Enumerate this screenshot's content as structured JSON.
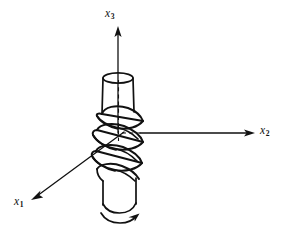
{
  "figure": {
    "background_color": "#ffffff",
    "line_color": "#111111"
  },
  "axes": [
    {
      "id": "x1",
      "label_base": "x",
      "label_subscript": "1",
      "direction": "lower-left (out of page toward viewer)",
      "origin": [
        122,
        133
      ],
      "tip": [
        32,
        200
      ],
      "label_position": [
        14,
        196
      ],
      "style": "solid",
      "arrowhead": true
    },
    {
      "id": "x2",
      "label_base": "x",
      "label_subscript": "2",
      "direction": "right (horizontal)",
      "origin": [
        122,
        133
      ],
      "tip": [
        254,
        133
      ],
      "label_position": [
        260,
        125
      ],
      "style": "solid",
      "arrowhead": true
    },
    {
      "id": "x3",
      "label_base": "x",
      "label_subscript": "3",
      "direction": "up (vertical, shaft axis)",
      "origin": [
        118,
        133
      ],
      "tip": [
        118,
        27
      ],
      "label_position": [
        105,
        8
      ],
      "style": "solid",
      "arrowhead": true
    }
  ],
  "shaft": {
    "name": "circular-shaft",
    "top_ellipse": {
      "cx": 118,
      "cy": 78,
      "rx": 15,
      "ry": 5
    },
    "bottom_arc": {
      "cx": 119,
      "cy": 208,
      "rx": 16,
      "ry": 6
    },
    "upper_segment": {
      "top_y": 78,
      "bottom_y": 113,
      "half_width": 15
    },
    "lower_segment": {
      "top_y": 178,
      "bottom_y": 208,
      "half_width": 16
    },
    "buckled_segment": {
      "top_y": 113,
      "bottom_y": 182,
      "turns": 3
    },
    "center_dashed_line": {
      "x": 118,
      "from_y": 78,
      "to_y": 140
    }
  },
  "torque_arrow": {
    "name": "torque-arc-arrow",
    "position": [
      119,
      216
    ],
    "direction": "counterclockwise-viewed-from-below",
    "description": "curved arc arrow at base of shaft indicating applied torque"
  },
  "helix_folds": [
    {
      "index": 1,
      "crest_y": 122
    },
    {
      "index": 2,
      "crest_y": 143
    },
    {
      "index": 3,
      "crest_y": 164
    }
  ]
}
